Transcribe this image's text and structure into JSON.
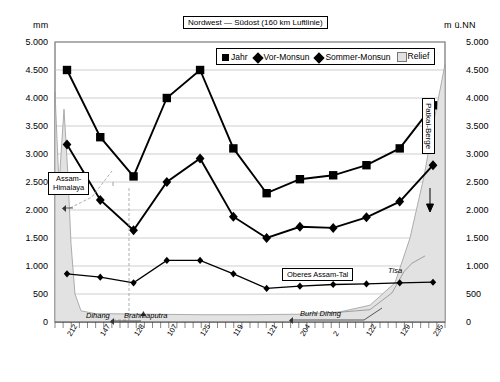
{
  "title": "Nordwest — Südost (160 km Luftlinie)",
  "axis": {
    "left_unit": "mm",
    "right_unit": "m ü.NN",
    "ticks": [
      "5.000",
      "4.500",
      "4.000",
      "3.500",
      "3.000",
      "2.500",
      "2.000",
      "1.500",
      "1.000",
      "500",
      "0"
    ]
  },
  "legend": {
    "items": [
      {
        "label": "Jahr",
        "marker": "square-marker",
        "color": "#000000"
      },
      {
        "label": "Vor-Monsun",
        "marker": "diamond-marker",
        "color": "#000000"
      },
      {
        "label": "Sommer-Monsun",
        "marker": "diamond-marker",
        "color": "#000000"
      },
      {
        "label": "Relief",
        "marker": "area-swatch",
        "color": "#e2e2e2"
      }
    ]
  },
  "annotations": {
    "assam_himalaya": "Assam-\nHimalaya",
    "assam_himalaya_l1": "Assam-",
    "assam_himalaya_l2": "Himalaya",
    "oberes_assam_tal": "Oberes Assam-Tal",
    "patkai_berge": "Patkai-Berge",
    "dihang": "Dihang",
    "brahmaputra": "Brahmaputra",
    "burhi_dihing": "Burhi Dihing",
    "tisa": "Tisa"
  },
  "chart_data": {
    "type": "line",
    "title": "Nordwest — Südost (160 km Luftlinie)",
    "xlabel": "",
    "ylabel": "mm",
    "ylabel_right": "m ü.NN",
    "ylim": [
      0,
      5000
    ],
    "ytick_values": [
      0,
      500,
      1000,
      1500,
      2000,
      2500,
      3000,
      3500,
      4000,
      4500,
      5000
    ],
    "grid": true,
    "legend_position": "top-right",
    "categories": [
      "212",
      "147",
      "128",
      "107",
      "125",
      "119",
      "121",
      "204",
      "2",
      "122",
      "129",
      "235"
    ],
    "series": [
      {
        "name": "Jahr",
        "marker": "square",
        "values": [
          4500,
          3300,
          2600,
          4000,
          4500,
          3100,
          2300,
          2550,
          2620,
          2800,
          3100,
          3870
        ]
      },
      {
        "name": "Vor-Monsun",
        "marker": "diamond",
        "values": [
          3170,
          2180,
          1640,
          2500,
          2920,
          1880,
          1500,
          1700,
          1680,
          1870,
          2150,
          2800
        ]
      },
      {
        "name": "Sommer-Monsun",
        "marker": "diamond-small",
        "values": [
          860,
          800,
          700,
          1100,
          1100,
          860,
          600,
          640,
          670,
          680,
          700,
          710
        ]
      },
      {
        "name": "Relief",
        "marker": "area",
        "values": [
          4100,
          150,
          140,
          130,
          130,
          130,
          130,
          140,
          180,
          300,
          1700,
          4600
        ]
      }
    ]
  }
}
